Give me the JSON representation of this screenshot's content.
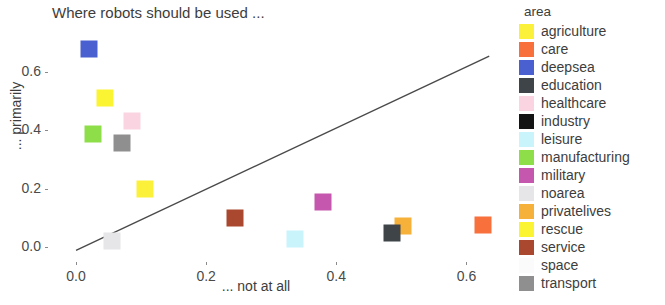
{
  "chart_data": {
    "type": "scatter",
    "title": "Where robots should be used ...",
    "xlabel": "... not at all",
    "ylabel": "... primarily",
    "xlim": [
      -0.04,
      0.67
    ],
    "ylim": [
      -0.045,
      0.765
    ],
    "xticks": [
      "0.0",
      "0.2",
      "0.4",
      "0.6"
    ],
    "xtick_values": [
      0.0,
      0.2,
      0.4,
      0.6
    ],
    "yticks": [
      "0.0",
      "0.2",
      "0.4",
      "0.6"
    ],
    "ytick_values": [
      0.0,
      0.2,
      0.4,
      0.6
    ],
    "grid": false,
    "legend_position": "right",
    "reference_line": {
      "x0": 0.0,
      "y0": -0.012,
      "x1": 0.635,
      "y1": 0.655,
      "color": "#4a4a4a"
    },
    "points": [
      {
        "label": "industry",
        "x": 0.035,
        "y": 0.8,
        "color": "#141414",
        "clipped_top": true
      },
      {
        "label": "deepsea",
        "x": 0.02,
        "y": 0.68,
        "color": "#4a5fd0"
      },
      {
        "label": "rescue",
        "x": 0.045,
        "y": 0.51,
        "color": "#fbf432"
      },
      {
        "label": "healthcare",
        "x": 0.086,
        "y": 0.432,
        "color": "#fbd4e2"
      },
      {
        "label": "manufacturing",
        "x": 0.026,
        "y": 0.386,
        "color": "#8ede4a"
      },
      {
        "label": "transport",
        "x": 0.071,
        "y": 0.356,
        "color": "#8f8f8f"
      },
      {
        "label": "agriculture",
        "x": 0.106,
        "y": 0.2,
        "color": "#fbf13a"
      },
      {
        "label": "military",
        "x": 0.38,
        "y": 0.155,
        "color": "#c558ae"
      },
      {
        "label": "service",
        "x": 0.245,
        "y": 0.1,
        "color": "#a9482f"
      },
      {
        "label": "privatelives",
        "x": 0.502,
        "y": 0.072,
        "color": "#f6b13a"
      },
      {
        "label": "care",
        "x": 0.625,
        "y": 0.074,
        "color": "#f8703c"
      },
      {
        "label": "education",
        "x": 0.486,
        "y": 0.046,
        "color": "#3f4449"
      },
      {
        "label": "leisure",
        "x": 0.336,
        "y": 0.027,
        "color": "#caf4fb"
      },
      {
        "label": "noarea",
        "x": 0.056,
        "y": 0.02,
        "color": "#e6e6e8"
      },
      {
        "label": "space",
        "x": null,
        "y": null,
        "color": "#fbfbfb"
      }
    ]
  },
  "legend": {
    "title": "area",
    "items": [
      {
        "label": "agriculture",
        "color": "#fbf13a"
      },
      {
        "label": "care",
        "color": "#f8703c"
      },
      {
        "label": "deepsea",
        "color": "#4a5fd0"
      },
      {
        "label": "education",
        "color": "#3f4449"
      },
      {
        "label": "healthcare",
        "color": "#fbd4e2"
      },
      {
        "label": "industry",
        "color": "#141414"
      },
      {
        "label": "leisure",
        "color": "#caf4fb"
      },
      {
        "label": "manufacturing",
        "color": "#8ede4a"
      },
      {
        "label": "military",
        "color": "#c558ae"
      },
      {
        "label": "noarea",
        "color": "#e6e6e8"
      },
      {
        "label": "privatelives",
        "color": "#f6b13a"
      },
      {
        "label": "rescue",
        "color": "#fbf432"
      },
      {
        "label": "service",
        "color": "#a9482f"
      },
      {
        "label": "space",
        "color": "#fbfbfb"
      },
      {
        "label": "transport",
        "color": "#8f8f8f"
      }
    ]
  }
}
